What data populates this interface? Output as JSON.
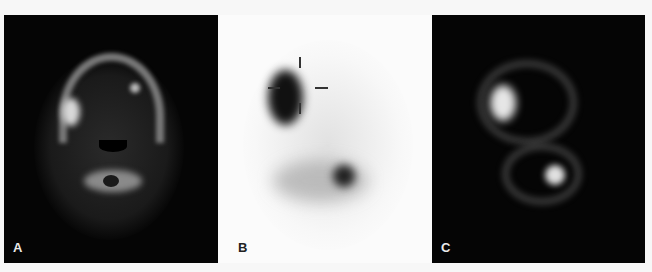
{
  "figure": {
    "panels": [
      {
        "id": "A",
        "label": "A",
        "description": "CT axial slice of neck (bone window)"
      },
      {
        "id": "B",
        "label": "B",
        "description": "SPECT axial slice with crosshair marker (inverted grayscale)"
      },
      {
        "id": "C",
        "label": "C",
        "description": "Fused SPECT/CT axial slice"
      }
    ]
  }
}
